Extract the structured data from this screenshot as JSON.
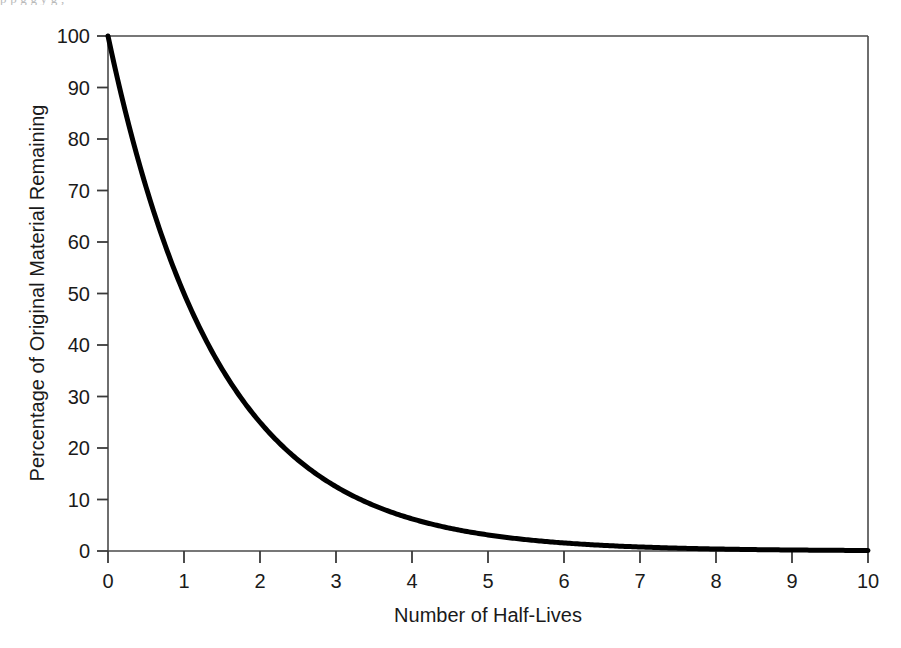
{
  "page": {
    "bleed_text": "p   p  g            g                    y                            g    ,"
  },
  "chart_data": {
    "type": "line",
    "title": "",
    "subtitle": "",
    "xlabel": "Number of Half-Lives",
    "ylabel": "Percentage of Original Material Remaining",
    "xlim": [
      0,
      10
    ],
    "ylim": [
      0,
      100
    ],
    "xticks": [
      0,
      1,
      2,
      3,
      4,
      5,
      6,
      7,
      8,
      9,
      10
    ],
    "xticklabels": [
      "0",
      "1",
      "2",
      "3",
      "4",
      "5",
      "6",
      "7",
      "8",
      "9",
      "10"
    ],
    "yticks": [
      0,
      10,
      20,
      30,
      40,
      50,
      60,
      70,
      80,
      90,
      100
    ],
    "yticklabels": [
      "0",
      "10",
      "20",
      "30",
      "40",
      "50",
      "60",
      "70",
      "80",
      "90",
      "100"
    ],
    "grid": false,
    "legend": null,
    "annotations": [],
    "series": [
      {
        "name": "Percentage remaining",
        "formula": "y = 100 * (0.5)^x",
        "color": "#000000",
        "linewidth": 5,
        "x": [
          0,
          0.5,
          1,
          1.5,
          2,
          2.5,
          3,
          3.5,
          4,
          4.5,
          5,
          5.5,
          6,
          6.5,
          7,
          7.5,
          8,
          8.5,
          9,
          9.5,
          10
        ],
        "values": [
          100,
          70.7,
          50,
          35.4,
          25,
          17.7,
          12.5,
          8.8,
          6.25,
          4.4,
          3.125,
          2.2,
          1.5625,
          1.1,
          0.78,
          0.55,
          0.39,
          0.28,
          0.195,
          0.14,
          0.098
        ]
      }
    ]
  },
  "colors": {
    "curve": "#000000",
    "axis": "#3a3a3a",
    "text": "#1a1a1a",
    "background": "#ffffff"
  }
}
